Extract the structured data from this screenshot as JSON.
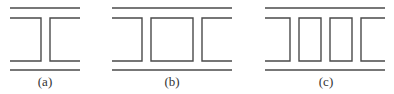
{
  "figure": {
    "stroke_color": "#4a4a4a",
    "panels": [
      {
        "id": "a",
        "label": "(a)",
        "x0": 10,
        "x1": 80,
        "gaps": [
          [
            41,
            50
          ]
        ],
        "label_x": 45
      },
      {
        "id": "b",
        "label": "(b)",
        "x0": 112,
        "x1": 232,
        "gaps": [
          [
            142,
            151
          ],
          [
            193,
            202
          ]
        ],
        "label_x": 172
      },
      {
        "id": "c",
        "label": "(c)",
        "x0": 265,
        "x1": 385,
        "gaps": [
          [
            290,
            299
          ],
          [
            321,
            330
          ],
          [
            352,
            361
          ]
        ],
        "label_x": 326
      }
    ],
    "y_outer_top": 8,
    "y_inner_top": 18,
    "y_inner_bottom": 61,
    "y_outer_bottom": 70,
    "y_label": 86
  }
}
